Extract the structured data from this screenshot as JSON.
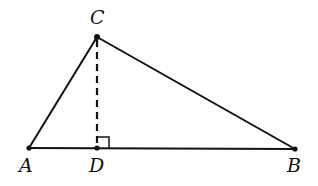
{
  "diagram": {
    "type": "triangle-with-altitude",
    "points": {
      "A": {
        "label": "A",
        "x": 29,
        "y": 148
      },
      "B": {
        "label": "B",
        "x": 295,
        "y": 149
      },
      "C": {
        "label": "C",
        "x": 97,
        "y": 37
      },
      "D": {
        "label": "D",
        "x": 97,
        "y": 148
      }
    },
    "segments": [
      {
        "from": "A",
        "to": "B",
        "style": "solid"
      },
      {
        "from": "A",
        "to": "C",
        "style": "solid"
      },
      {
        "from": "B",
        "to": "C",
        "style": "solid"
      },
      {
        "from": "C",
        "to": "D",
        "style": "dashed"
      }
    ],
    "right_angle_at": "D",
    "colors": {
      "stroke": "#111111",
      "background": "#ffffff"
    }
  }
}
